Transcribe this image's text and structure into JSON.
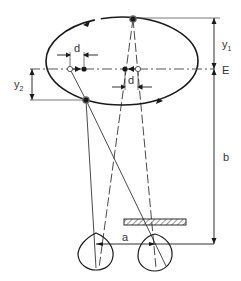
{
  "diagram": {
    "labels": {
      "y1": "y",
      "y1_sub": "1",
      "y2": "y",
      "y2_sub": "2",
      "E": "E",
      "b": "b",
      "a": "a",
      "d_left": "d",
      "d_right": "d"
    },
    "colors": {
      "stroke": "#1a1a1a",
      "light": "#555555",
      "background": "#ffffff"
    }
  }
}
